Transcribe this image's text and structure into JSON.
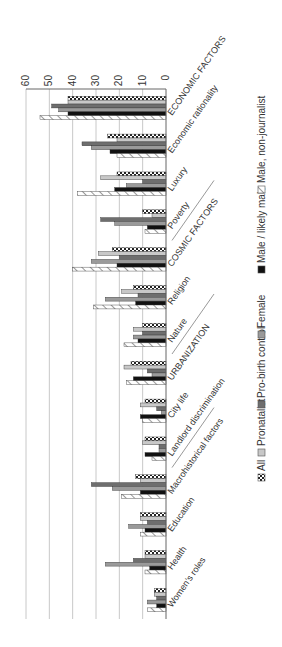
{
  "chart_data": {
    "type": "bar",
    "orientation": "vertical bars, image rotated 90deg clockwise",
    "title": "",
    "xlabel": "",
    "ylabel": "",
    "ylim": [
      0,
      60
    ],
    "yticks": [
      0,
      10,
      20,
      30,
      40,
      50,
      60
    ],
    "grid": true,
    "legend_position": "bottom",
    "categories": [
      "ECONOMIC FACTORS",
      "Economic rationality",
      "Luxury",
      "Poverty",
      "COSMIC FACTORS",
      "Religion",
      "Nature",
      "URBANIZATION",
      "City life",
      "Landlord discrimination",
      "Macrohistorical factors",
      "Education",
      "Health",
      "Women's roles"
    ],
    "separators_after": [
      3,
      6,
      9
    ],
    "series": [
      {
        "name": "All",
        "pattern": "checker",
        "color": "#333333",
        "values": [
          42,
          25,
          21,
          10,
          23,
          14,
          10,
          15,
          9,
          9,
          13,
          11,
          9,
          5
        ]
      },
      {
        "name": "Pronatalist",
        "pattern": "solid",
        "color": "#c8c8c8",
        "values": [
          42,
          21,
          28,
          6,
          29,
          19,
          14,
          18,
          11,
          10,
          11,
          11,
          9,
          5
        ]
      },
      {
        "name": "Pro-birth control",
        "pattern": "solid",
        "color": "#6e6e6e",
        "values": [
          49,
          36,
          10,
          28,
          20,
          12,
          10,
          8,
          4,
          3,
          32,
          8,
          14,
          4
        ]
      },
      {
        "name": "Female",
        "pattern": "solid",
        "color": "#9a9a9a",
        "values": [
          46,
          32,
          17,
          22,
          32,
          26,
          14,
          6,
          2,
          3,
          23,
          16,
          26,
          8
        ]
      },
      {
        "name": "Male / likely male",
        "pattern": "solid",
        "color": "#111111",
        "values": [
          42,
          24,
          22,
          8,
          21,
          13,
          12,
          14,
          11,
          9,
          11,
          9,
          7,
          4
        ]
      },
      {
        "name": "Male, non-journalist",
        "pattern": "hatch",
        "color": "#ffffff",
        "values": [
          54,
          21,
          38,
          9,
          40,
          31,
          18,
          17,
          10,
          6,
          19,
          11,
          9,
          8
        ]
      }
    ]
  },
  "legend": {
    "items": [
      {
        "label": "All",
        "icon": "checker-swatch-icon"
      },
      {
        "label": "Pronatalist",
        "icon": "light-gray-swatch-icon"
      },
      {
        "label": "Pro-birth control",
        "icon": "dark-gray-swatch-icon"
      },
      {
        "label": "Female",
        "icon": "mid-gray-swatch-icon"
      },
      {
        "label": "Male / likely male",
        "icon": "black-swatch-icon"
      },
      {
        "label": "Male, non-journalist",
        "icon": "hatched-swatch-icon"
      }
    ]
  }
}
